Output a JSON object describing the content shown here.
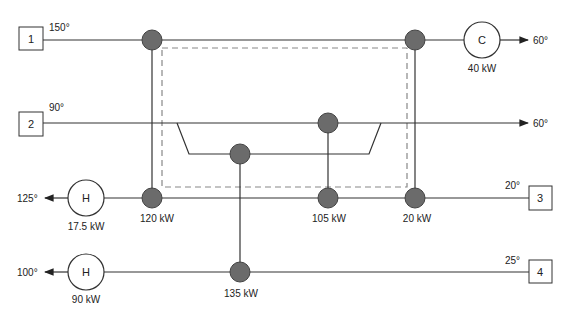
{
  "colors": {
    "line": "#333333",
    "node_fill": "#6b6b6b",
    "node_stroke": "#444444",
    "dashed_box": "#888888",
    "background": "#ffffff"
  },
  "streams": [
    {
      "id": "1",
      "inlet_temp": "150°",
      "outlet_temp": "60°",
      "direction": "right"
    },
    {
      "id": "2",
      "inlet_temp": "90°",
      "outlet_temp": "60°",
      "direction": "right"
    },
    {
      "id": "3",
      "inlet_temp": "20°",
      "outlet_temp": "125°",
      "direction": "left"
    },
    {
      "id": "4",
      "inlet_temp": "25°",
      "outlet_temp": "100°",
      "direction": "left"
    }
  ],
  "utilities": [
    {
      "type": "cooler",
      "symbol": "C",
      "duty": "40 kW",
      "stream": "1"
    },
    {
      "type": "heater",
      "symbol": "H",
      "duty": "17.5 kW",
      "stream": "3"
    },
    {
      "type": "heater",
      "symbol": "H",
      "duty": "90 kW",
      "stream": "4"
    }
  ],
  "exchangers": [
    {
      "duty": "120 kW",
      "hot_stream": "1",
      "cold_stream": "3"
    },
    {
      "duty": "105 kW",
      "hot_stream": "2",
      "cold_stream": "3"
    },
    {
      "duty": "20 kW",
      "hot_stream": "1",
      "cold_stream": "3"
    },
    {
      "duty": "135 kW",
      "hot_stream": "2",
      "cold_stream": "4"
    }
  ]
}
